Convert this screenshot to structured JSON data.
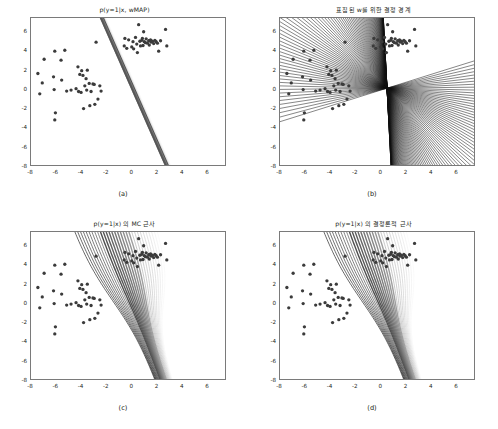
{
  "figure": {
    "background": "#ffffff",
    "axis_color": "#7a7a7a",
    "point_color": "#3b3b3b",
    "line_color": "#111111"
  },
  "panels": [
    {
      "id": "a",
      "caption": "(a)",
      "title": "p(y=1|x, wMAP)",
      "xticks": [
        "-8",
        "-6",
        "-4",
        "-2",
        "0",
        "2",
        "4",
        "6"
      ],
      "yticks": [
        "6",
        "4",
        "2",
        "0",
        "-2",
        "-4",
        "-6",
        "-8"
      ],
      "xlim": [
        -8,
        7.5
      ],
      "ylim": [
        -8,
        7.5
      ],
      "render": "map-sigmoid-band"
    },
    {
      "id": "b",
      "caption": "(b)",
      "title": "표집된 w를 위한 결정 경계",
      "xticks": [
        "-8",
        "-6",
        "-4",
        "-2",
        "0",
        "2",
        "4",
        "6"
      ],
      "yticks": [
        "6",
        "4",
        "2",
        "0",
        "-2",
        "-4",
        "-6",
        "-8"
      ],
      "xlim": [
        -8,
        7.5
      ],
      "ylim": [
        -8,
        7.5
      ],
      "render": "sampled-boundaries"
    },
    {
      "id": "c",
      "caption": "(c)",
      "title": "p(y=1|x) 의 MC 근사",
      "xticks": [
        "-8",
        "-6",
        "-4",
        "-2",
        "0",
        "2",
        "4",
        "6"
      ],
      "yticks": [
        "6",
        "4",
        "2",
        "0",
        "-2",
        "-4",
        "-6",
        "-8"
      ],
      "xlim": [
        -8,
        7.5
      ],
      "ylim": [
        -8,
        7.5
      ],
      "render": "mc-contours"
    },
    {
      "id": "d",
      "caption": "(d)",
      "title": "p(y=1|x) 의 결정론적 근사",
      "xticks": [
        "-8",
        "-6",
        "-4",
        "-2",
        "0",
        "2",
        "4",
        "6"
      ],
      "yticks": [
        "6",
        "4",
        "2",
        "0",
        "-2",
        "-4",
        "-6",
        "-8"
      ],
      "xlim": [
        -8,
        7.5
      ],
      "ylim": [
        -8,
        7.5
      ],
      "render": "probit-contours"
    }
  ],
  "chart_data": {
    "type": "scatter",
    "xlabel": "",
    "ylabel": "",
    "xlim": [
      -8,
      7.5
    ],
    "ylim": [
      -8,
      7.5
    ],
    "grid": false,
    "legend": "none",
    "classes": [
      {
        "name": "class 0",
        "marker": "circle",
        "color": "#3b3b3b",
        "points": [
          [
            -7.45,
            1.65
          ],
          [
            -7.3,
            -0.5
          ],
          [
            -7.1,
            0.65
          ],
          [
            -6.95,
            3.15
          ],
          [
            -6.2,
            1.3
          ],
          [
            -6.15,
            -0.05
          ],
          [
            -6.1,
            4.0
          ],
          [
            -6.05,
            -2.5
          ],
          [
            -6.1,
            -3.25
          ],
          [
            -5.6,
            3.05
          ],
          [
            -5.55,
            0.95
          ],
          [
            -5.3,
            4.1
          ],
          [
            -5.15,
            -0.2
          ],
          [
            -4.8,
            -0.1
          ],
          [
            -4.4,
            0.05
          ],
          [
            -4.25,
            2.35
          ],
          [
            -4.2,
            -0.25
          ],
          [
            -4.1,
            1.55
          ],
          [
            -4.0,
            -0.35
          ],
          [
            -3.95,
            1.95
          ],
          [
            -3.85,
            1.45
          ],
          [
            -3.8,
            -2.05
          ],
          [
            -3.7,
            0.35
          ],
          [
            -3.6,
            1.1
          ],
          [
            -3.55,
            -0.1
          ],
          [
            -3.5,
            2.0
          ],
          [
            -3.35,
            0.6
          ],
          [
            -3.3,
            -1.75
          ],
          [
            -3.2,
            -0.25
          ],
          [
            -3.05,
            0.55
          ],
          [
            -2.95,
            0.5
          ],
          [
            -2.9,
            -1.6
          ],
          [
            -2.8,
            4.95
          ],
          [
            -2.65,
            -1.05
          ],
          [
            -2.5,
            0.35
          ],
          [
            -2.4,
            -0.2
          ]
        ]
      },
      {
        "name": "class 1",
        "marker": "circle",
        "color": "#3b3b3b",
        "points": [
          [
            -0.55,
            4.55
          ],
          [
            -0.5,
            5.35
          ],
          [
            -0.35,
            4.3
          ],
          [
            -0.2,
            5.2
          ],
          [
            0.05,
            4.45
          ],
          [
            0.15,
            5.0
          ],
          [
            0.2,
            4.25
          ],
          [
            0.35,
            5.45
          ],
          [
            0.45,
            4.75
          ],
          [
            0.5,
            3.85
          ],
          [
            0.6,
            6.8
          ],
          [
            0.7,
            5.05
          ],
          [
            0.75,
            4.55
          ],
          [
            0.85,
            5.15
          ],
          [
            0.9,
            5.35
          ],
          [
            0.95,
            4.6
          ],
          [
            1.0,
            6.05
          ],
          [
            1.05,
            5.0
          ],
          [
            1.15,
            4.9
          ],
          [
            1.2,
            5.3
          ],
          [
            1.3,
            4.85
          ],
          [
            1.4,
            5.1
          ],
          [
            1.45,
            4.65
          ],
          [
            1.55,
            5.2
          ],
          [
            1.6,
            4.95
          ],
          [
            1.7,
            5.05
          ],
          [
            1.8,
            4.8
          ],
          [
            1.9,
            5.15
          ],
          [
            2.0,
            5.0
          ],
          [
            2.1,
            4.85
          ],
          [
            2.2,
            4.0
          ],
          [
            2.35,
            5.1
          ],
          [
            2.75,
            6.3
          ],
          [
            2.85,
            4.55
          ]
        ]
      }
    ],
    "panels": [
      {
        "id": "a",
        "title": "p(y=1|x, wMAP)",
        "description": "MAP plug-in predictive: a single sharp sigmoid band oriented along the MAP decision boundary",
        "boundary_slope": -3.0,
        "boundary_intercept": 0.9,
        "band_width": 0.9,
        "n_levels": 1
      },
      {
        "id": "b",
        "title": "표집된 w를 위한 결정 경계",
        "description": "Decision boundaries for weights sampled from the posterior; all lines pass through a common pivot",
        "pivot": [
          0.55,
          0.1
        ],
        "n_samples": 100,
        "slope_range": [
          -40,
          0.4
        ]
      },
      {
        "id": "c",
        "title": "p(y=1|x) 의 MC 근사",
        "description": "Monte Carlo approximation of the posterior predictive: broad fan of contour levels",
        "n_levels": 24,
        "pivot": [
          0.55,
          0.1
        ]
      },
      {
        "id": "d",
        "title": "p(y=1|x) 의 결정론적 근사",
        "description": "Deterministic (probit) approximation of the posterior predictive: broad fan of contour levels",
        "n_levels": 24,
        "pivot": [
          0.55,
          0.1
        ]
      }
    ]
  }
}
